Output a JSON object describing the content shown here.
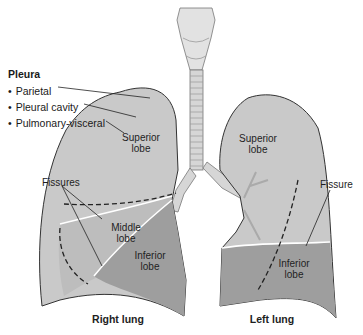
{
  "legend": {
    "title": "Pleura",
    "items": [
      "Parietal",
      "Pleural cavity",
      "Pulmonary-visceral"
    ]
  },
  "labels": {
    "right_superior": [
      "Superior",
      "lobe"
    ],
    "right_middle": [
      "Middle",
      "lobe"
    ],
    "right_inferior": [
      "Inferior",
      "lobe"
    ],
    "left_superior": [
      "Superior",
      "lobe"
    ],
    "left_inferior": [
      "Inferior",
      "lobe"
    ],
    "fissures_right": "Fissures",
    "fissure_left": "Fissure",
    "right_lung": "Right lung",
    "left_lung": "Left lung"
  },
  "colors": {
    "lung_upper": "#c9c9c9",
    "lung_lower": "#9e9e9e",
    "outline": "#333333",
    "trachea": "#d8d8d8"
  }
}
